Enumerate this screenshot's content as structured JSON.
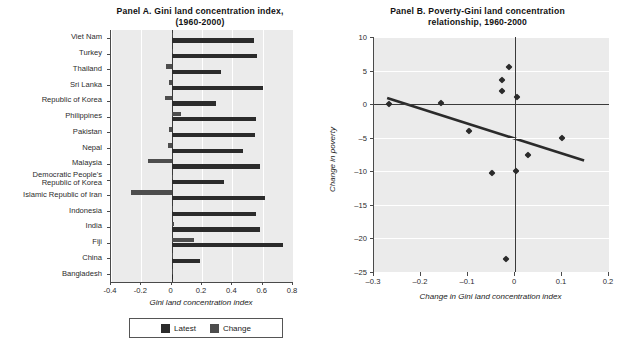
{
  "figure": {
    "cropped_top_caption": ""
  },
  "panelA": {
    "title": "Panel A. Gini land concentration index, (1960-2000)",
    "xlabel": "Gini land concentration index",
    "xticks": [
      "-0.4",
      "-0.2",
      "0",
      "0.2",
      "0.4",
      "0.6",
      "0.8"
    ],
    "xlim": [
      -0.4,
      0.8
    ],
    "legend": [
      {
        "key": "latest",
        "label": "Latest",
        "color": "#2b2b2b"
      },
      {
        "key": "change",
        "label": "Change",
        "color": "#4d4d4d"
      }
    ]
  },
  "panelB": {
    "title": "Panel B. Poverty-Gini land concentration relationship, 1960-2000",
    "xlabel": "Change in Gini land concentration index",
    "ylabel": "Change in poverty",
    "xticks": [
      "-0.3",
      "-0.2",
      "-0.1",
      "0",
      "0.1",
      "0.2"
    ],
    "yticks": [
      "10",
      "5",
      "0",
      "-5",
      "-10",
      "-15",
      "-20",
      "-25"
    ],
    "xlim": [
      -0.3,
      0.2
    ],
    "ylim": [
      -25,
      10
    ]
  },
  "chart_data": [
    {
      "type": "bar",
      "orientation": "horizontal",
      "title": "Panel A. Gini land concentration index, (1960-2000)",
      "xlabel": "Gini land concentration index",
      "ylabel": "",
      "xlim": [
        -0.4,
        0.8
      ],
      "grid": true,
      "legend_position": "bottom",
      "categories": [
        "Viet Nam",
        "Turkey",
        "Thailand",
        "Sri Lanka",
        "Republic of Korea",
        "Philippines",
        "Pakistan",
        "Nepal",
        "Malaysia",
        "Democratic People's Republic of Korea",
        "Islamic Republic of Iran",
        "Indonesia",
        "India",
        "Fiji",
        "China",
        "Bangladesh"
      ],
      "series": [
        {
          "name": "Change",
          "color": "#4d4d4d",
          "values": [
            0.0,
            0.005,
            -0.035,
            -0.015,
            -0.045,
            0.06,
            -0.015,
            -0.025,
            -0.155,
            0.0,
            -0.265,
            0.0,
            0.015,
            0.145,
            0.0,
            0.0
          ]
        },
        {
          "name": "Latest",
          "color": "#2b2b2b",
          "values": [
            0.545,
            0.565,
            0.325,
            0.605,
            0.29,
            0.555,
            0.55,
            0.47,
            0.58,
            0.345,
            0.615,
            0.555,
            0.585,
            0.735,
            0.185,
            0.0
          ]
        }
      ]
    },
    {
      "type": "scatter",
      "title": "Panel B. Poverty-Gini land concentration relationship, 1960-2000",
      "xlabel": "Change in Gini land concentration index",
      "ylabel": "Change in poverty",
      "xlim": [
        -0.3,
        0.2
      ],
      "ylim": [
        -25,
        10
      ],
      "grid": true,
      "points": [
        {
          "x": -0.268,
          "y": 0.0
        },
        {
          "x": -0.158,
          "y": 0.1
        },
        {
          "x": -0.012,
          "y": 5.5
        },
        {
          "x": -0.027,
          "y": 3.6
        },
        {
          "x": -0.027,
          "y": 1.9
        },
        {
          "x": 0.004,
          "y": 1.1
        },
        {
          "x": -0.098,
          "y": -4.0
        },
        {
          "x": 0.028,
          "y": -7.5
        },
        {
          "x": 0.101,
          "y": -5.0
        },
        {
          "x": -0.049,
          "y": -10.2
        },
        {
          "x": 0.002,
          "y": -9.9
        },
        {
          "x": -0.019,
          "y": -23.1
        }
      ],
      "trendline": {
        "type": "linear",
        "x": [
          -0.272,
          0.147
        ],
        "y": [
          0.9,
          -8.4
        ]
      }
    }
  ]
}
